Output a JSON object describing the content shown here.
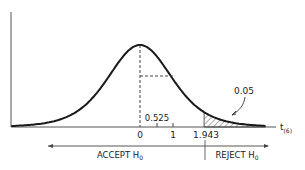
{
  "chart_data": {
    "type": "line",
    "title": "",
    "distribution": "Student t, 6 degrees of freedom",
    "xlabel": "t",
    "xlabel_subscript": "(6)",
    "ylabel": "",
    "tick_labels": [
      "0",
      "1",
      "1.943"
    ],
    "ticks": [
      0,
      1,
      1.943
    ],
    "annotations": {
      "observed_value": "0.525",
      "observed_t": 0.525,
      "critical_value": "1.943",
      "tail_area": "0.05",
      "accept_label": "ACCEPT H",
      "reject_label": "REJECT H",
      "hypothesis_subscript": "0"
    },
    "shaded_region": {
      "from": 1.943,
      "to": 3.8,
      "area": 0.05
    },
    "xlim": [
      -3.9,
      3.8
    ],
    "grid": false,
    "legend": "none"
  }
}
